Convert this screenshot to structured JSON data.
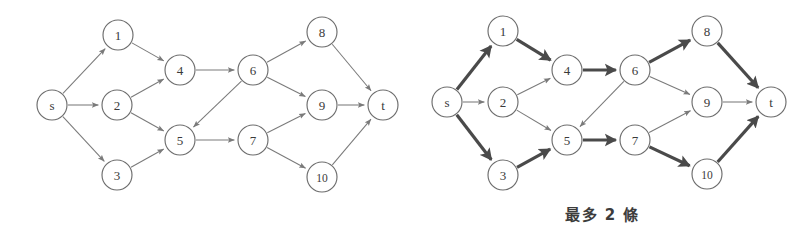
{
  "figure": {
    "background_color": "#ffffff",
    "node_stroke_color": "#6d6d6d",
    "thin_edge_color": "#7a7a7a",
    "bold_edge_color": "#4a4a4a",
    "label_color": "#3a3a3a"
  },
  "graphs": [
    {
      "id": "left-graph",
      "name": "plain-flow-network",
      "origin_x": 0,
      "nodes": [
        {
          "id": "s",
          "label": "s",
          "x": 52,
          "y": 105,
          "r": 15
        },
        {
          "id": "1",
          "label": "1",
          "x": 118,
          "y": 35,
          "r": 15
        },
        {
          "id": "2",
          "label": "2",
          "x": 117,
          "y": 105,
          "r": 15
        },
        {
          "id": "3",
          "label": "3",
          "x": 117,
          "y": 175,
          "r": 15
        },
        {
          "id": "4",
          "label": "4",
          "x": 180,
          "y": 70,
          "r": 15
        },
        {
          "id": "5",
          "label": "5",
          "x": 180,
          "y": 140,
          "r": 15
        },
        {
          "id": "6",
          "label": "6",
          "x": 253,
          "y": 70,
          "r": 15
        },
        {
          "id": "7",
          "label": "7",
          "x": 253,
          "y": 140,
          "r": 15
        },
        {
          "id": "8",
          "label": "8",
          "x": 322,
          "y": 32,
          "r": 15
        },
        {
          "id": "9",
          "label": "9",
          "x": 322,
          "y": 105,
          "r": 15
        },
        {
          "id": "10",
          "label": "10",
          "x": 322,
          "y": 177,
          "r": 15
        },
        {
          "id": "t",
          "label": "t",
          "x": 383,
          "y": 105,
          "r": 15
        }
      ],
      "edges": [
        {
          "from": "s",
          "to": "1",
          "weight": "thin"
        },
        {
          "from": "s",
          "to": "2",
          "weight": "thin"
        },
        {
          "from": "s",
          "to": "3",
          "weight": "thin"
        },
        {
          "from": "1",
          "to": "4",
          "weight": "thin"
        },
        {
          "from": "2",
          "to": "4",
          "weight": "thin"
        },
        {
          "from": "2",
          "to": "5",
          "weight": "thin"
        },
        {
          "from": "3",
          "to": "5",
          "weight": "thin"
        },
        {
          "from": "4",
          "to": "6",
          "weight": "thin"
        },
        {
          "from": "6",
          "to": "5",
          "weight": "thin"
        },
        {
          "from": "5",
          "to": "7",
          "weight": "thin"
        },
        {
          "from": "6",
          "to": "8",
          "weight": "thin"
        },
        {
          "from": "6",
          "to": "9",
          "weight": "thin"
        },
        {
          "from": "7",
          "to": "9",
          "weight": "thin"
        },
        {
          "from": "7",
          "to": "10",
          "weight": "thin"
        },
        {
          "from": "8",
          "to": "t",
          "weight": "thin"
        },
        {
          "from": "9",
          "to": "t",
          "weight": "thin"
        },
        {
          "from": "10",
          "to": "t",
          "weight": "thin"
        }
      ]
    },
    {
      "id": "right-graph",
      "name": "highlighted-flow-network",
      "origin_x": 395,
      "nodes": [
        {
          "id": "s",
          "label": "s",
          "x": 52,
          "y": 102,
          "r": 15
        },
        {
          "id": "1",
          "label": "1",
          "x": 108,
          "y": 31,
          "r": 15
        },
        {
          "id": "2",
          "label": "2",
          "x": 108,
          "y": 102,
          "r": 15
        },
        {
          "id": "3",
          "label": "3",
          "x": 108,
          "y": 175,
          "r": 15
        },
        {
          "id": "4",
          "label": "4",
          "x": 172,
          "y": 70,
          "r": 15
        },
        {
          "id": "5",
          "label": "5",
          "x": 172,
          "y": 140,
          "r": 15
        },
        {
          "id": "6",
          "label": "6",
          "x": 240,
          "y": 70,
          "r": 15
        },
        {
          "id": "7",
          "label": "7",
          "x": 240,
          "y": 140,
          "r": 15
        },
        {
          "id": "8",
          "label": "8",
          "x": 312,
          "y": 31,
          "r": 15
        },
        {
          "id": "9",
          "label": "9",
          "x": 312,
          "y": 102,
          "r": 15
        },
        {
          "id": "10",
          "label": "10",
          "x": 312,
          "y": 174,
          "r": 15
        },
        {
          "id": "t",
          "label": "t",
          "x": 376,
          "y": 102,
          "r": 15
        }
      ],
      "edges": [
        {
          "from": "s",
          "to": "1",
          "weight": "bold"
        },
        {
          "from": "s",
          "to": "2",
          "weight": "thin"
        },
        {
          "from": "s",
          "to": "3",
          "weight": "bold"
        },
        {
          "from": "1",
          "to": "4",
          "weight": "bold"
        },
        {
          "from": "2",
          "to": "4",
          "weight": "thin"
        },
        {
          "from": "2",
          "to": "5",
          "weight": "thin"
        },
        {
          "from": "3",
          "to": "5",
          "weight": "bold"
        },
        {
          "from": "4",
          "to": "6",
          "weight": "bold"
        },
        {
          "from": "6",
          "to": "5",
          "weight": "thin"
        },
        {
          "from": "5",
          "to": "7",
          "weight": "bold"
        },
        {
          "from": "6",
          "to": "8",
          "weight": "bold"
        },
        {
          "from": "6",
          "to": "9",
          "weight": "thin"
        },
        {
          "from": "7",
          "to": "9",
          "weight": "thin"
        },
        {
          "from": "7",
          "to": "10",
          "weight": "bold"
        },
        {
          "from": "8",
          "to": "t",
          "weight": "bold"
        },
        {
          "from": "9",
          "to": "t",
          "weight": "thin"
        },
        {
          "from": "10",
          "to": "t",
          "weight": "bold"
        }
      ],
      "caption": {
        "text": "最多 2 條",
        "x": 565,
        "y": 203
      }
    }
  ]
}
